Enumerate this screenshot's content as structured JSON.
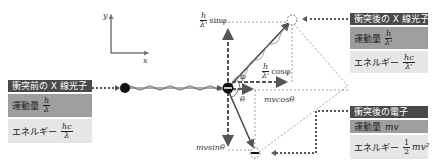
{
  "axes": {
    "x_label": "x",
    "y_label": "y"
  },
  "incident_photon": {
    "title": "衝突前の X 線光子",
    "momentum_label": "運動量",
    "momentum_num": "h",
    "momentum_den": "λ",
    "energy_label": "エネルギー",
    "energy_num": "hc",
    "energy_den": "λ"
  },
  "scattered_photon": {
    "title": "衝突後の X 線光子",
    "momentum_label": "運動量",
    "momentum_num": "h",
    "momentum_den": "λ'",
    "energy_label": "エネルギー",
    "energy_num": "hc",
    "energy_den": "λ'"
  },
  "recoil_electron": {
    "title": "衝突後の電子",
    "momentum_label": "運動量",
    "momentum_value": "mv",
    "energy_label": "エネルギー",
    "energy_num": "1",
    "energy_den": "2",
    "energy_suffix": "mv²"
  },
  "labels": {
    "sin_phi_frac_num": "h",
    "sin_phi_frac_den": "λ'",
    "sin_phi": "sinφ",
    "cos_phi_frac_num": "h",
    "cos_phi_frac_den": "λ'",
    "cos_phi": "cosφ",
    "phi": "φ",
    "theta": "θ",
    "mv_cos": "mvcosθ",
    "mv_sin": "mvsinθ"
  },
  "colors": {
    "header": "#4a4a4a",
    "momentum_row": "#9e9e9e",
    "energy_row": "#e6e6e6",
    "line": "#555555"
  }
}
